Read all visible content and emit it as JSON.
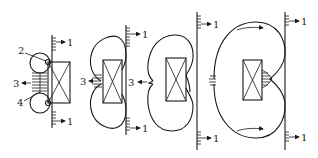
{
  "figure": {
    "type": "flow-pattern-diagram",
    "panels": [
      {
        "id": "panel-1",
        "labels": {
          "wall_flow_top": "1",
          "wall_flow_bottom": "1",
          "center_flow": "3",
          "callout_top": "2",
          "callout_bottom": "4"
        }
      },
      {
        "id": "panel-2",
        "labels": {
          "wall_flow_top": "1",
          "wall_flow_bottom": "1",
          "center_flow": "3"
        }
      },
      {
        "id": "panel-3",
        "labels": {
          "wall_flow_top": "1",
          "wall_flow_bottom": "1",
          "center_flow": "3"
        }
      },
      {
        "id": "panel-4",
        "labels": {
          "wall_flow_top": "1",
          "wall_flow_bottom": "1"
        }
      }
    ]
  }
}
